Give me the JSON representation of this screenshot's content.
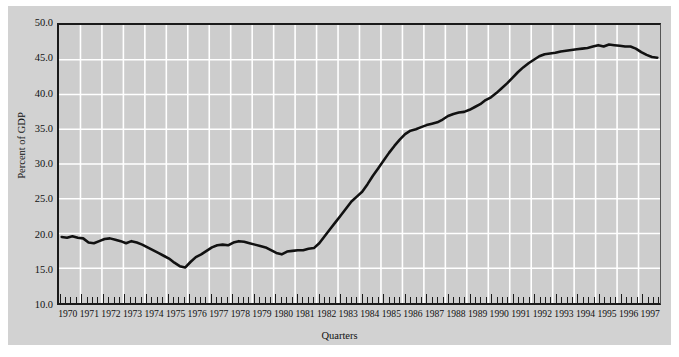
{
  "chart_data": {
    "type": "line",
    "title": "",
    "xlabel": "Quarters",
    "ylabel": "Percent of GDP",
    "ylim": [
      10.0,
      50.0
    ],
    "ytick_labels": [
      "50.0",
      "45.0",
      "40.0",
      "35.0",
      "30.0",
      "25.0",
      "20.0",
      "15.0",
      "10.0"
    ],
    "ytick_values": [
      50.0,
      45.0,
      40.0,
      35.0,
      30.0,
      25.0,
      20.0,
      15.0,
      10.0
    ],
    "grid": true,
    "grid_color": "#ffffff",
    "legend": "none",
    "line_color": "#111111",
    "plot_bg": "#cdcdcd",
    "figure_bg": "#d2d2d2",
    "x_tick_interval": "quarterly",
    "xtick_labels": [
      "1970",
      "1971",
      "1972",
      "1973",
      "1974",
      "1975",
      "1976",
      "1977",
      "1978",
      "1979",
      "1980",
      "1981",
      "1982",
      "1983",
      "1984",
      "1985",
      "1986",
      "1987",
      "1988",
      "1989",
      "1990",
      "1991",
      "1992",
      "1993",
      "1994",
      "1995",
      "1996",
      "1997"
    ],
    "categories": [
      "1970Q1",
      "1970Q2",
      "1970Q3",
      "1970Q4",
      "1971Q1",
      "1971Q2",
      "1971Q3",
      "1971Q4",
      "1972Q1",
      "1972Q2",
      "1972Q3",
      "1972Q4",
      "1973Q1",
      "1973Q2",
      "1973Q3",
      "1973Q4",
      "1974Q1",
      "1974Q2",
      "1974Q3",
      "1974Q4",
      "1975Q1",
      "1975Q2",
      "1975Q3",
      "1975Q4",
      "1976Q1",
      "1976Q2",
      "1976Q3",
      "1976Q4",
      "1977Q1",
      "1977Q2",
      "1977Q3",
      "1977Q4",
      "1978Q1",
      "1978Q2",
      "1978Q3",
      "1978Q4",
      "1979Q1",
      "1979Q2",
      "1979Q3",
      "1979Q4",
      "1980Q1",
      "1980Q2",
      "1980Q3",
      "1980Q4",
      "1981Q1",
      "1981Q2",
      "1981Q3",
      "1981Q4",
      "1982Q1",
      "1982Q2",
      "1982Q3",
      "1982Q4",
      "1983Q1",
      "1983Q2",
      "1983Q3",
      "1983Q4",
      "1984Q1",
      "1984Q2",
      "1984Q3",
      "1984Q4",
      "1985Q1",
      "1985Q2",
      "1985Q3",
      "1985Q4",
      "1986Q1",
      "1986Q2",
      "1986Q3",
      "1986Q4",
      "1987Q1",
      "1987Q2",
      "1987Q3",
      "1987Q4",
      "1988Q1",
      "1988Q2",
      "1988Q3",
      "1988Q4",
      "1989Q1",
      "1989Q2",
      "1989Q3",
      "1989Q4",
      "1990Q1",
      "1990Q2",
      "1990Q3",
      "1990Q4",
      "1991Q1",
      "1991Q2",
      "1991Q3",
      "1991Q4",
      "1992Q1",
      "1992Q2",
      "1992Q3",
      "1992Q4",
      "1993Q1",
      "1993Q2",
      "1993Q3",
      "1993Q4",
      "1994Q1",
      "1994Q2",
      "1994Q3",
      "1994Q4",
      "1995Q1",
      "1995Q2",
      "1995Q3",
      "1995Q4",
      "1996Q1",
      "1996Q2",
      "1996Q3",
      "1996Q4",
      "1997Q1",
      "1997Q2",
      "1997Q3",
      "1997Q4"
    ],
    "values": [
      19.5,
      19.4,
      19.6,
      19.4,
      19.3,
      18.7,
      18.6,
      18.9,
      19.2,
      19.3,
      19.1,
      18.9,
      18.6,
      18.9,
      18.7,
      18.4,
      18.0,
      17.6,
      17.2,
      16.8,
      16.4,
      15.8,
      15.3,
      15.1,
      15.9,
      16.6,
      17.0,
      17.5,
      18.0,
      18.3,
      18.4,
      18.3,
      18.7,
      18.9,
      18.8,
      18.6,
      18.4,
      18.2,
      18.0,
      17.6,
      17.2,
      17.0,
      17.4,
      17.5,
      17.6,
      17.6,
      17.8,
      17.9,
      18.6,
      19.6,
      20.6,
      21.6,
      22.6,
      23.6,
      24.6,
      25.3,
      26.0,
      27.1,
      28.3,
      29.4,
      30.5,
      31.6,
      32.6,
      33.5,
      34.3,
      34.8,
      35.0,
      35.3,
      35.6,
      35.8,
      36.0,
      36.4,
      36.9,
      37.2,
      37.4,
      37.5,
      37.8,
      38.2,
      38.6,
      39.2,
      39.6,
      40.2,
      40.9,
      41.6,
      42.4,
      43.2,
      43.9,
      44.5,
      45.0,
      45.5,
      45.8,
      45.9,
      46.0,
      46.2,
      46.3,
      46.4,
      46.5,
      46.6,
      46.7,
      46.9,
      47.1,
      46.9,
      47.2,
      47.1,
      47.0,
      46.9,
      46.9,
      46.6,
      46.1,
      45.7,
      45.4,
      45.3
    ]
  }
}
